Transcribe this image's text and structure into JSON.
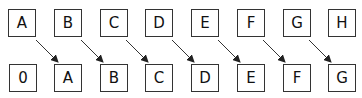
{
  "diagram": {
    "top_row": [
      "A",
      "B",
      "C",
      "D",
      "E",
      "F",
      "G",
      "H"
    ],
    "bottom_row": [
      "0",
      "A",
      "B",
      "C",
      "D",
      "E",
      "F",
      "G"
    ],
    "arrows": [
      {
        "from": "top.0",
        "to": "bottom.1"
      },
      {
        "from": "top.1",
        "to": "bottom.2"
      },
      {
        "from": "top.2",
        "to": "bottom.3"
      },
      {
        "from": "top.3",
        "to": "bottom.4"
      },
      {
        "from": "top.4",
        "to": "bottom.5"
      },
      {
        "from": "top.5",
        "to": "bottom.6"
      },
      {
        "from": "top.6",
        "to": "bottom.7"
      }
    ],
    "colors": {
      "stroke": "#333333",
      "text": "#111111",
      "background": "#ffffff"
    }
  }
}
